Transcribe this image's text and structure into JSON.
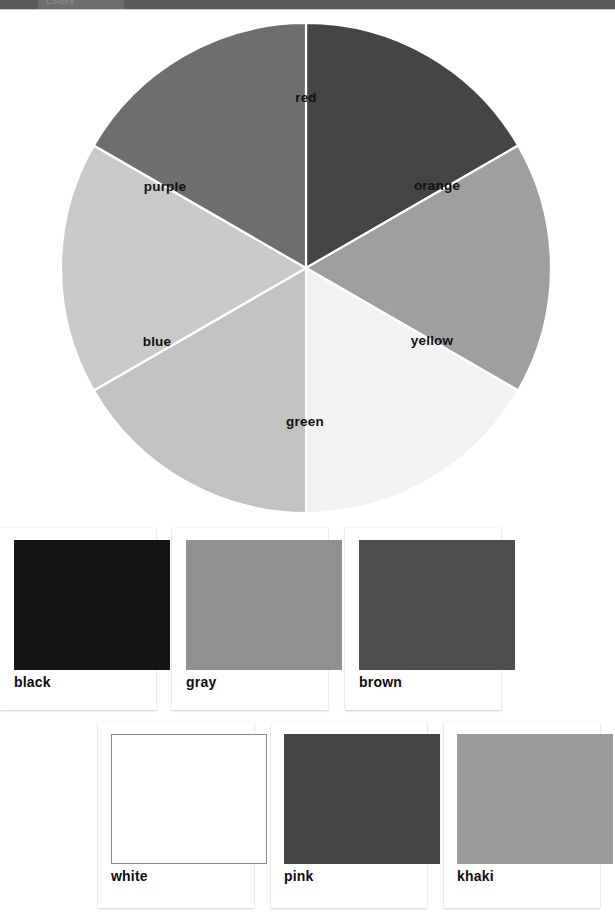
{
  "toolbar": {
    "tab_label": "Colors"
  },
  "wheel": {
    "center_x": 306,
    "center_y": 258,
    "radius": 245,
    "separator_color": "#ffffff",
    "slices": [
      {
        "label": "red",
        "start_angle": -90,
        "end_angle": -30,
        "fill": "#454545",
        "label_x": 306,
        "label_y": 87
      },
      {
        "label": "orange",
        "start_angle": -30,
        "end_angle": 30,
        "fill": "#9f9f9f",
        "label_x": 437,
        "label_y": 175
      },
      {
        "label": "yellow",
        "start_angle": 30,
        "end_angle": 90,
        "fill": "#f2f2f2",
        "label_x": 432,
        "label_y": 330
      },
      {
        "label": "green",
        "start_angle": 90,
        "end_angle": 150,
        "fill": "#c2c2c2",
        "label_x": 305,
        "label_y": 411
      },
      {
        "label": "blue",
        "start_angle": 150,
        "end_angle": 210,
        "fill": "#c9c9c9",
        "label_x": 157,
        "label_y": 331
      },
      {
        "label": "purple",
        "start_angle": 210,
        "end_angle": 270,
        "fill": "#6e6e6e",
        "label_x": 165,
        "label_y": 176
      }
    ]
  },
  "swatch_rows": [
    {
      "row_name": "swatch-row-1",
      "cards": [
        {
          "label": "black",
          "fill": "#151515",
          "left": 0,
          "bordered": false
        },
        {
          "label": "gray",
          "fill": "#909090",
          "left": 172,
          "bordered": false
        },
        {
          "label": "brown",
          "fill": "#4e4e4e",
          "left": 345,
          "bordered": false
        }
      ]
    },
    {
      "row_name": "swatch-row-2",
      "cards": [
        {
          "label": "white",
          "fill": "#ffffff",
          "left": 98,
          "bordered": true
        },
        {
          "label": "pink",
          "fill": "#454545",
          "left": 271,
          "bordered": false
        },
        {
          "label": "khaki",
          "fill": "#9b9b9b",
          "left": 444,
          "bordered": false
        }
      ]
    }
  ]
}
